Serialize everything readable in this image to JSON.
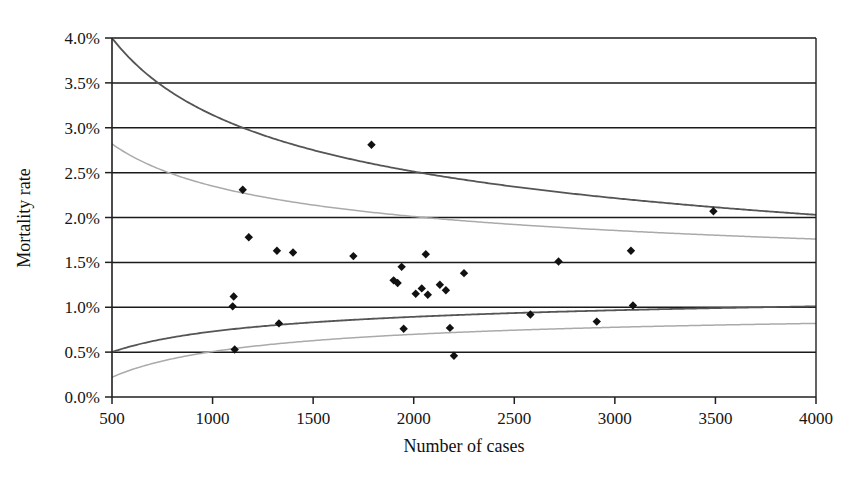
{
  "chart_data": {
    "type": "scatter",
    "title": "",
    "xlabel": "Number of cases",
    "ylabel": "Mortality rate",
    "xlim": [
      500,
      4000
    ],
    "ylim": [
      0.0,
      4.0
    ],
    "xticks": [
      500,
      1000,
      1500,
      2000,
      2500,
      3000,
      3500,
      4000
    ],
    "xtick_labels": [
      "500",
      "1000",
      "1500",
      "2000",
      "2500",
      "3000",
      "3500",
      "4000"
    ],
    "yticks": [
      0.0,
      0.5,
      1.0,
      1.5,
      2.0,
      2.5,
      3.0,
      3.5,
      4.0
    ],
    "ytick_labels": [
      "0.0%",
      "0.5%",
      "1.0%",
      "1.5%",
      "2.0%",
      "2.5%",
      "3.0%",
      "3.5%",
      "4.0%"
    ],
    "grid": "horizontal",
    "legend": "none",
    "marker": "diamond",
    "marker_color": "#111111",
    "points": [
      {
        "x": 1100,
        "y": 1.01
      },
      {
        "x": 1105,
        "y": 1.12
      },
      {
        "x": 1110,
        "y": 0.53
      },
      {
        "x": 1150,
        "y": 2.31
      },
      {
        "x": 1180,
        "y": 1.78
      },
      {
        "x": 1320,
        "y": 1.63
      },
      {
        "x": 1330,
        "y": 0.82
      },
      {
        "x": 1400,
        "y": 1.61
      },
      {
        "x": 1700,
        "y": 1.57
      },
      {
        "x": 1790,
        "y": 2.81
      },
      {
        "x": 1900,
        "y": 1.3
      },
      {
        "x": 1920,
        "y": 1.27
      },
      {
        "x": 1940,
        "y": 1.45
      },
      {
        "x": 1950,
        "y": 0.76
      },
      {
        "x": 2010,
        "y": 1.15
      },
      {
        "x": 2040,
        "y": 1.21
      },
      {
        "x": 2060,
        "y": 1.59
      },
      {
        "x": 2070,
        "y": 1.14
      },
      {
        "x": 2130,
        "y": 1.25
      },
      {
        "x": 2160,
        "y": 1.19
      },
      {
        "x": 2180,
        "y": 0.77
      },
      {
        "x": 2200,
        "y": 0.46
      },
      {
        "x": 2250,
        "y": 1.38
      },
      {
        "x": 2580,
        "y": 0.92
      },
      {
        "x": 2720,
        "y": 1.51
      },
      {
        "x": 2910,
        "y": 0.84
      },
      {
        "x": 3080,
        "y": 1.63
      },
      {
        "x": 3090,
        "y": 1.02
      },
      {
        "x": 3490,
        "y": 2.07
      }
    ],
    "curves": [
      {
        "name": "upper-outer-limit",
        "color": "#555555",
        "style": "solid",
        "endpoints": [
          {
            "x": 500,
            "y": 4.0
          },
          {
            "x": 4000,
            "y": 2.03
          }
        ]
      },
      {
        "name": "upper-inner-limit",
        "color": "#aaaaaa",
        "style": "solid",
        "endpoints": [
          {
            "x": 500,
            "y": 2.82
          },
          {
            "x": 4000,
            "y": 1.76
          }
        ]
      },
      {
        "name": "lower-inner-limit",
        "color": "#555555",
        "style": "solid",
        "endpoints": [
          {
            "x": 500,
            "y": 0.5
          },
          {
            "x": 4000,
            "y": 1.01
          }
        ]
      },
      {
        "name": "lower-outer-limit",
        "color": "#aaaaaa",
        "style": "solid",
        "endpoints": [
          {
            "x": 500,
            "y": 0.22
          },
          {
            "x": 4000,
            "y": 0.82
          }
        ]
      }
    ],
    "center_line": 1.28
  },
  "axes": {
    "frame_color": "#202020",
    "gridline_color": "#1a1a1a"
  }
}
